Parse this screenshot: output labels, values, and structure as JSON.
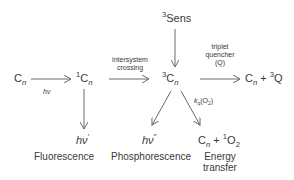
{
  "species": {
    "cn_ground": {
      "base": "C",
      "sub": "n"
    },
    "singlet": {
      "sup": "1",
      "base": "C",
      "sub": "n"
    },
    "triplet": {
      "sup": "3",
      "base": "C",
      "sub": "n"
    },
    "sens": {
      "sup": "3",
      "base": "Sens"
    },
    "quench_product": {
      "base": "C",
      "sub": "n",
      "plus": " + ",
      "sup2": "3",
      "base2": "Q"
    },
    "fluor_photon": {
      "base": "hν",
      "sup": "′"
    },
    "phos_photon": {
      "base": "hν",
      "sup": "″"
    },
    "energy_product": {
      "base": "C",
      "sub": "n",
      "plus": " + ",
      "sup2": "1",
      "base2": "O",
      "sub2": "2"
    }
  },
  "arrow_labels": {
    "excitation": "hν",
    "isc_line1": "intersystem",
    "isc_line2": "crossing",
    "quench_line1": "triplet",
    "quench_line2": "quencher",
    "quench_line3": "(Q)",
    "kq_base": "k",
    "kq_sub": "q",
    "kq_rest": "(O",
    "kq_sub2": "2",
    "kq_close": ")"
  },
  "captions": {
    "fluorescence": "Fluorescence",
    "phosphorescence": "Phosphorescence",
    "energy_line1": "Energy",
    "energy_line2": "transfer"
  },
  "colors": {
    "line": "#6a6a6a",
    "text": "#3a3a3a"
  }
}
